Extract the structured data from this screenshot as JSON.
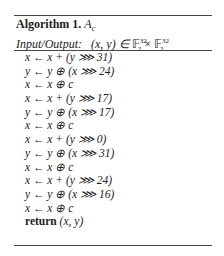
{
  "algorithm": {
    "label": "Algorithm 1.",
    "name": "A",
    "name_sub": "c",
    "io_label": "Input/Output:",
    "io_math": "(x, y) ∈ 𝔽₂³² × 𝔽₂³²",
    "io_tuple": "(x, y) ∈ ",
    "io_field": "𝔽",
    "io_sup": "32",
    "io_sub": "2",
    "io_times": " × ",
    "steps": [
      "x ← x + (y ⋙ 31)",
      "y ← y ⊕ (x ⋙ 24)",
      "x ← x ⊕ c",
      "x ← x + (y ⋙ 17)",
      "y ← y ⊕ (x ⋙ 17)",
      "x ← x ⊕ c",
      "x ← x + (y ⋙ 0)",
      "y ← y ⊕ (x ⋙ 31)",
      "x ← x ⊕ c",
      "x ← x + (y ⋙ 24)",
      "y ← y ⊕ (x ⋙ 16)",
      "x ← x ⊕ c"
    ],
    "return_keyword": "return",
    "return_value": "(x, y)"
  }
}
